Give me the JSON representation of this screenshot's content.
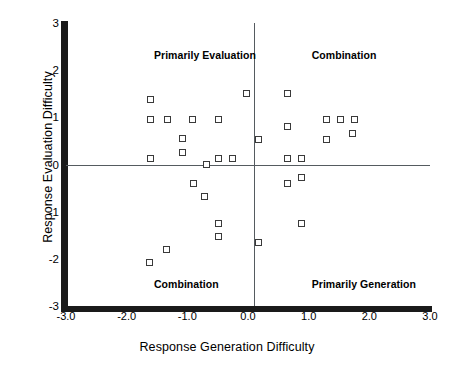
{
  "chart_data": {
    "type": "scatter",
    "title": "",
    "xlabel": "Response Generation Difficulty",
    "ylabel": "Response Evaluation Difficulty",
    "xlim": [
      -3.0,
      3.0
    ],
    "ylim": [
      -3.0,
      3.0
    ],
    "grid": false,
    "legend": null,
    "xticks": [
      "-3.0",
      "-2.0",
      "-1.0",
      "0.0",
      "1.0",
      "2.0",
      "3.0"
    ],
    "xtick_values": [
      -3.0,
      -2.0,
      -1.0,
      0.0,
      1.0,
      2.0,
      3.0
    ],
    "yticks": [
      "3",
      "2",
      "1",
      "0",
      "-1",
      "-2",
      "-3"
    ],
    "ytick_values": [
      3,
      2,
      1,
      0,
      -1,
      -2,
      -3
    ],
    "reference_lines": [
      {
        "orientation": "horizontal",
        "value": 0.0
      },
      {
        "orientation": "vertical",
        "value": 0.1
      }
    ],
    "annotations": [
      {
        "text": "Primarily Evaluation",
        "x": -1.55,
        "y": 2.45,
        "quadrant": "upper-left"
      },
      {
        "text": "Combination",
        "x": 1.05,
        "y": 2.45,
        "quadrant": "upper-right"
      },
      {
        "text": "Combination",
        "x": -1.55,
        "y": -2.4,
        "quadrant": "lower-left"
      },
      {
        "text": "Primarily Generation",
        "x": 1.05,
        "y": -2.4,
        "quadrant": "lower-right"
      }
    ],
    "marker_style": "open-square",
    "points": [
      {
        "x": -1.6,
        "y": 1.38
      },
      {
        "x": -1.6,
        "y": 0.95
      },
      {
        "x": -1.33,
        "y": 0.95
      },
      {
        "x": -0.92,
        "y": 0.95
      },
      {
        "x": -0.48,
        "y": 0.95
      },
      {
        "x": -1.08,
        "y": 0.55
      },
      {
        "x": -1.08,
        "y": 0.25
      },
      {
        "x": -1.6,
        "y": 0.12
      },
      {
        "x": -0.48,
        "y": 0.12
      },
      {
        "x": -0.25,
        "y": 0.12
      },
      {
        "x": -0.68,
        "y": 0.0
      },
      {
        "x": -0.02,
        "y": 1.5
      },
      {
        "x": 0.18,
        "y": 0.53
      },
      {
        "x": -0.9,
        "y": -0.4
      },
      {
        "x": -0.72,
        "y": -0.68
      },
      {
        "x": -0.48,
        "y": -1.25
      },
      {
        "x": -0.48,
        "y": -1.53
      },
      {
        "x": -1.35,
        "y": -1.8
      },
      {
        "x": -1.62,
        "y": -2.08
      },
      {
        "x": 0.65,
        "y": 1.5
      },
      {
        "x": 0.65,
        "y": 0.8
      },
      {
        "x": 1.3,
        "y": 0.95
      },
      {
        "x": 1.52,
        "y": 0.95
      },
      {
        "x": 1.75,
        "y": 0.95
      },
      {
        "x": 1.3,
        "y": 0.53
      },
      {
        "x": 1.72,
        "y": 0.65
      },
      {
        "x": 0.65,
        "y": 0.12
      },
      {
        "x": 0.88,
        "y": 0.12
      },
      {
        "x": 0.65,
        "y": -0.4
      },
      {
        "x": 0.88,
        "y": -0.28
      },
      {
        "x": 0.88,
        "y": -1.25
      },
      {
        "x": 0.18,
        "y": -1.65
      }
    ]
  },
  "colors": {
    "axis": "#1a1a1a",
    "reference_line": "#555b60",
    "marker_edge": "#3a3a3a",
    "marker_fill": "#ffffff",
    "background": "#ffffff",
    "text": "#000000"
  }
}
